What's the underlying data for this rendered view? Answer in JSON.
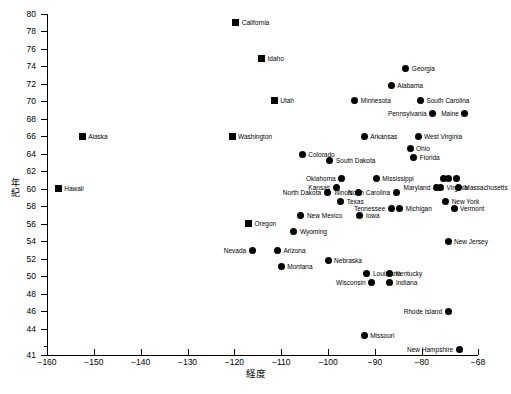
{
  "chart_data": {
    "type": "scatter",
    "title": "",
    "xlabel": "経度",
    "ylabel": "年紀",
    "xlim": [
      -160,
      -68
    ],
    "ylim": [
      41,
      80
    ],
    "xticks": [
      -160,
      -150,
      -140,
      -130,
      -120,
      -110,
      -100,
      -90,
      -80,
      -68
    ],
    "yticks": [
      41,
      44,
      46,
      48,
      50,
      52,
      54,
      56,
      58,
      60,
      62,
      64,
      66,
      68,
      70,
      72,
      74,
      76,
      78,
      80
    ],
    "grid": false,
    "legend": null,
    "marker_shapes": [
      "square",
      "circle"
    ],
    "points": [
      {
        "label": "California",
        "x": -119.7,
        "y": 79.0,
        "marker": "square",
        "side": "right"
      },
      {
        "label": "Idaho",
        "x": -114.2,
        "y": 74.9,
        "marker": "square",
        "side": "right"
      },
      {
        "label": "Georgia",
        "x": -83.4,
        "y": 73.8,
        "marker": "circle",
        "side": "right"
      },
      {
        "label": "Alabama",
        "x": -86.5,
        "y": 71.8,
        "marker": "circle",
        "side": "right"
      },
      {
        "label": "Utah",
        "x": -111.5,
        "y": 70.1,
        "marker": "square",
        "side": "right"
      },
      {
        "label": "Minnesota",
        "x": -94.3,
        "y": 70.1,
        "marker": "circle",
        "side": "right"
      },
      {
        "label": "South Carolina",
        "x": -80.3,
        "y": 70.1,
        "marker": "circle",
        "side": "right"
      },
      {
        "label": "Pennsylvania",
        "x": -77.7,
        "y": 68.6,
        "marker": "circle",
        "side": "left"
      },
      {
        "label": "Maine",
        "x": -70.8,
        "y": 68.6,
        "marker": "circle",
        "side": "left"
      },
      {
        "label": "Alaska",
        "x": -152.5,
        "y": 66.0,
        "marker": "square",
        "side": "right"
      },
      {
        "label": "Washington",
        "x": -120.5,
        "y": 66.0,
        "marker": "square",
        "side": "right"
      },
      {
        "label": "Arkansas",
        "x": -92.3,
        "y": 66.0,
        "marker": "circle",
        "side": "right"
      },
      {
        "label": "West Virginia",
        "x": -80.8,
        "y": 66.0,
        "marker": "circle",
        "side": "right"
      },
      {
        "label": "Ohio",
        "x": -82.5,
        "y": 64.6,
        "marker": "circle",
        "side": "right"
      },
      {
        "label": "Colorado",
        "x": -105.5,
        "y": 63.9,
        "marker": "circle",
        "side": "right"
      },
      {
        "label": "Florida",
        "x": -81.7,
        "y": 63.6,
        "marker": "circle",
        "side": "right"
      },
      {
        "label": "South Dakota",
        "x": -99.6,
        "y": 63.3,
        "marker": "circle",
        "side": "right"
      },
      {
        "label": "Hawaii",
        "x": -157.6,
        "y": 60.0,
        "marker": "square",
        "side": "right"
      },
      {
        "label": "Oklahoma",
        "x": -97.1,
        "y": 61.2,
        "marker": "circle",
        "side": "left"
      },
      {
        "label": "Mississippi",
        "x": -89.7,
        "y": 61.2,
        "marker": "circle",
        "side": "right"
      },
      {
        "label": "Delaware",
        "x": -75.3,
        "y": 61.2,
        "marker": "circle",
        "side": "none"
      },
      {
        "label": "Delaware2",
        "x": -74.4,
        "y": 61.2,
        "marker": "circle",
        "side": "none"
      },
      {
        "label": "Connecticut",
        "x": -72.6,
        "y": 61.2,
        "marker": "circle",
        "side": "none"
      },
      {
        "label": "Kansas",
        "x": -98.3,
        "y": 60.2,
        "marker": "circle",
        "side": "left"
      },
      {
        "label": "Maryland",
        "x": -76.9,
        "y": 60.2,
        "marker": "circle",
        "side": "left"
      },
      {
        "label": "Virginia",
        "x": -76.0,
        "y": 60.2,
        "marker": "circle",
        "side": "right"
      },
      {
        "label": "Massachusetts",
        "x": -72.2,
        "y": 60.2,
        "marker": "circle",
        "side": "right"
      },
      {
        "label": "North Dakota",
        "x": -100.2,
        "y": 59.6,
        "marker": "circle",
        "side": "left"
      },
      {
        "label": "Illinois",
        "x": -93.5,
        "y": 59.6,
        "marker": "circle",
        "side": "left"
      },
      {
        "label": "North Carolina",
        "x": -85.5,
        "y": 59.6,
        "marker": "circle",
        "side": "left"
      },
      {
        "label": "New York",
        "x": -74.9,
        "y": 58.6,
        "marker": "circle",
        "side": "right"
      },
      {
        "label": "Texas",
        "x": -97.3,
        "y": 58.6,
        "marker": "circle",
        "side": "right"
      },
      {
        "label": "Michigan",
        "x": -84.7,
        "y": 57.8,
        "marker": "circle",
        "side": "right"
      },
      {
        "label": "Tennessee",
        "x": -86.5,
        "y": 57.8,
        "marker": "circle",
        "side": "left"
      },
      {
        "label": "Vermont",
        "x": -73.1,
        "y": 57.8,
        "marker": "circle",
        "side": "right"
      },
      {
        "label": "New Mexico",
        "x": -105.8,
        "y": 56.9,
        "marker": "circle",
        "side": "right"
      },
      {
        "label": "Iowa",
        "x": -93.2,
        "y": 56.9,
        "marker": "circle",
        "side": "right"
      },
      {
        "label": "Oregon",
        "x": -117.0,
        "y": 56.0,
        "marker": "square",
        "side": "right"
      },
      {
        "label": "Wyoming",
        "x": -107.3,
        "y": 55.1,
        "marker": "circle",
        "side": "right"
      },
      {
        "label": "New Jersey",
        "x": -74.4,
        "y": 54.0,
        "marker": "circle",
        "side": "right"
      },
      {
        "label": "Nevada",
        "x": -116.2,
        "y": 53.0,
        "marker": "circle",
        "side": "left"
      },
      {
        "label": "Arizona",
        "x": -110.8,
        "y": 53.0,
        "marker": "circle",
        "side": "right"
      },
      {
        "label": "Nebraska",
        "x": -100.0,
        "y": 51.8,
        "marker": "circle",
        "side": "right"
      },
      {
        "label": "Montana",
        "x": -110.0,
        "y": 51.1,
        "marker": "circle",
        "side": "right"
      },
      {
        "label": "Louisiana",
        "x": -91.7,
        "y": 50.3,
        "marker": "circle",
        "side": "right"
      },
      {
        "label": "Kentucky",
        "x": -86.9,
        "y": 50.3,
        "marker": "circle",
        "side": "right"
      },
      {
        "label": "Wisconsin",
        "x": -90.7,
        "y": 49.3,
        "marker": "circle",
        "side": "left"
      },
      {
        "label": "Indiana",
        "x": -86.8,
        "y": 49.3,
        "marker": "circle",
        "side": "right"
      },
      {
        "label": "Rhode Island",
        "x": -74.4,
        "y": 46.0,
        "marker": "circle",
        "side": "left"
      },
      {
        "label": "Missouri",
        "x": -92.3,
        "y": 43.2,
        "marker": "circle",
        "side": "right"
      },
      {
        "label": "New Hampshire",
        "x": -72.0,
        "y": 41.6,
        "marker": "circle",
        "side": "left"
      }
    ]
  },
  "bottom_note": ""
}
